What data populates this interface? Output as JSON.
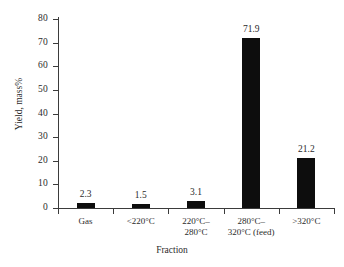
{
  "chart_data": {
    "type": "bar",
    "title": "",
    "subtitle": "",
    "xlabel": "Fraction",
    "ylabel": "Yield, mass%",
    "categories": [
      "Gas",
      "<220°C",
      "220°C–\n280°C",
      "280°C–\n320°C (feed)",
      ">320°C"
    ],
    "values": [
      2.3,
      1.5,
      3.1,
      71.9,
      21.2
    ],
    "data_labels": [
      "2.3",
      "1.5",
      "3.1",
      "71.9",
      "21.2"
    ],
    "ylim": [
      0,
      80
    ],
    "yticks": [
      0,
      10,
      20,
      30,
      40,
      50,
      60,
      70,
      80
    ],
    "ytick_labels": [
      "0",
      "10",
      "20",
      "30",
      "40",
      "50",
      "60",
      "70",
      "80"
    ],
    "grid": false,
    "legend": false,
    "legend_position": "none",
    "bar_color": "#0d0d0d",
    "axis_color": "#3b3b3b",
    "background_color": "#ffffff",
    "text_color": "#2b2b2b"
  }
}
